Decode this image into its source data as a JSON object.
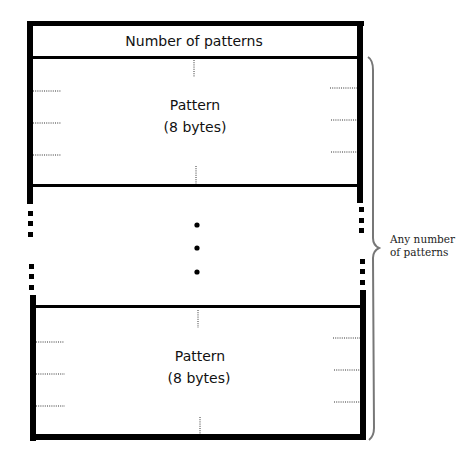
{
  "diagram": {
    "header": {
      "label": "Number of patterns"
    },
    "blocks": [
      {
        "line1": "Pattern",
        "line2": "(8 bytes)"
      },
      {
        "line1": "Pattern",
        "line2": "(8 bytes)"
      }
    ],
    "ellipsis": "•••",
    "brace_label": {
      "line1": "Any number",
      "line2": "of patterns"
    }
  }
}
